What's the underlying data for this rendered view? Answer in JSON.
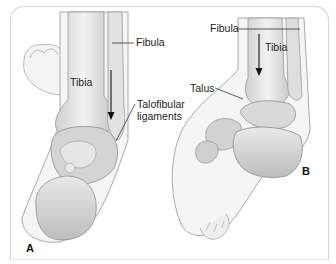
{
  "figure": {
    "panels": [
      {
        "id": "A",
        "letter": "A",
        "view": "posterior view of ankle",
        "labels": {
          "fibula": "Fibula",
          "tibia": "Tibia",
          "talofibular_line1": "Talofibular",
          "talofibular_line2": "ligaments"
        }
      },
      {
        "id": "B",
        "letter": "B",
        "view": "lateral view of ankle",
        "labels": {
          "fibula": "Fibula",
          "tibia": "Tibia",
          "talus": "Talus"
        }
      }
    ],
    "colors": {
      "bone_light": "#eeeeee",
      "bone_mid": "#d2d2d2",
      "bone_dark": "#a9a9a9",
      "skin": "#f3f3f3",
      "outline": "#9a9a9a",
      "frame": "#d4d4d4",
      "text": "#222222"
    }
  }
}
